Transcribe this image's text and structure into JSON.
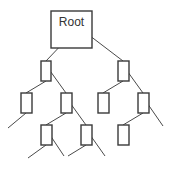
{
  "diagram": {
    "type": "tree",
    "colors": {
      "stroke": "#3a3a3a",
      "edge": "#4a4a4a",
      "background": "#ffffff",
      "text": "#333333"
    },
    "root": {
      "label": "Root",
      "x": 51,
      "y": 11,
      "w": 41,
      "h": 37
    },
    "nodes": [
      {
        "id": "n1",
        "x": 41,
        "y": 61,
        "w": 10,
        "h": 20
      },
      {
        "id": "n2",
        "x": 118,
        "y": 61,
        "w": 11,
        "h": 20
      },
      {
        "id": "n3",
        "x": 21,
        "y": 93,
        "w": 11,
        "h": 20
      },
      {
        "id": "n4",
        "x": 61,
        "y": 93,
        "w": 11,
        "h": 20
      },
      {
        "id": "n5",
        "x": 98,
        "y": 93,
        "w": 11,
        "h": 20
      },
      {
        "id": "n6",
        "x": 138,
        "y": 93,
        "w": 11,
        "h": 20
      },
      {
        "id": "n7",
        "x": 41,
        "y": 125,
        "w": 11,
        "h": 20
      },
      {
        "id": "n8",
        "x": 81,
        "y": 125,
        "w": 11,
        "h": 20
      },
      {
        "id": "n9",
        "x": 118,
        "y": 125,
        "w": 11,
        "h": 20
      }
    ],
    "edges": [
      [
        57,
        40,
        84,
        40
      ],
      [
        66,
        40,
        46,
        61
      ],
      [
        81,
        29,
        123,
        61
      ],
      [
        46,
        81,
        26,
        93
      ],
      [
        48,
        68,
        66,
        93
      ],
      [
        123,
        81,
        103,
        93
      ],
      [
        125,
        68,
        143,
        93
      ],
      [
        26,
        113,
        8,
        128
      ],
      [
        66,
        113,
        46,
        125
      ],
      [
        68,
        100,
        86,
        125
      ],
      [
        143,
        113,
        123,
        125
      ],
      [
        145,
        100,
        163,
        126
      ],
      [
        46,
        145,
        28,
        158
      ],
      [
        48,
        132,
        64,
        156
      ],
      [
        86,
        145,
        68,
        156
      ],
      [
        88,
        132,
        105,
        156
      ]
    ]
  }
}
